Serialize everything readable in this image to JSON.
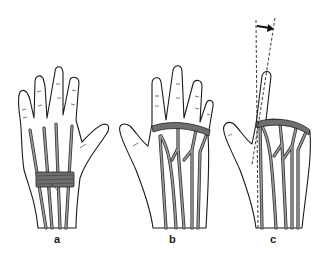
{
  "figure": {
    "panels": [
      {
        "id": "a",
        "label": "a",
        "description": "Dorsal hand, extensor tendons with band wrapped around wrist/distal forearm"
      },
      {
        "id": "b",
        "label": "b",
        "description": "Dorsal hand, extensor tendons with juncturae tendinum and band across MCP joints"
      },
      {
        "id": "c",
        "label": "c",
        "description": "Dorsal hand with index finger extended, dashed lines and arrow showing angular deviation"
      }
    ],
    "colors": {
      "line": "#1a1a1a",
      "tendon": "#333333",
      "band": "#6f6f6f",
      "background": "#ffffff"
    }
  }
}
